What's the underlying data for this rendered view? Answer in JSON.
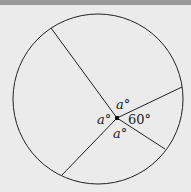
{
  "diagram": {
    "type": "circle with four radii-like segments from an interior point",
    "labels": {
      "top": "a°",
      "left": "a°",
      "bottom": "a°",
      "right": "60°"
    },
    "colors": {
      "background": "#ebebeb",
      "stroke": "#222222",
      "top_band": "#9a9a9a"
    }
  }
}
